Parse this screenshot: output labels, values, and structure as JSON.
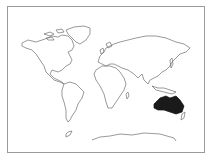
{
  "map": {
    "type": "world-outline",
    "highlighted_region": "Australia",
    "colors": {
      "background": "#ffffff",
      "frame": "#9a9a9a",
      "outline": "#6f6f6f",
      "highlight": "#1a1a1a"
    }
  }
}
